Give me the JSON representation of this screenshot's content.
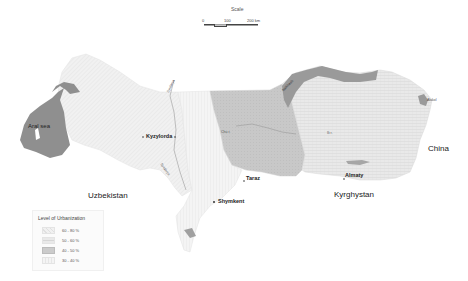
{
  "scale": {
    "title": "Scale",
    "ticks": [
      "0",
      "100",
      "200 km"
    ]
  },
  "countries": {
    "uzbekistan": "Uzbekistan",
    "kyrghystan": "Kyrghystan",
    "china": "China"
  },
  "water": {
    "aral_sea": "Aral sea",
    "balkhash": "Balkhash",
    "alakol": "Alakol",
    "syrdarya_north": "Syrdarya",
    "syrdarya_south": "Syrdarya",
    "chu": "Chu r.",
    "ili": "Ili r."
  },
  "cities": {
    "kyzylorda": "Kyzylorda",
    "taraz": "Taraz",
    "shymkent": "Shymkent",
    "almaty": "Almaty"
  },
  "legend": {
    "title": "Level of Urbanization",
    "items": [
      {
        "label": "60 - 80 %",
        "color": "#ececec"
      },
      {
        "label": "50 - 60 %",
        "color": "#e2e2e2"
      },
      {
        "label": "40 - 50 %",
        "color": "#d2d2d2"
      },
      {
        "label": "30 - 40 %",
        "color": "#f4f4f4"
      }
    ]
  },
  "colors": {
    "kyzylorda_region": "#efefef",
    "south_kaz_region": "#f2f2f2",
    "zhambyl_region": "#c9c9c9",
    "almaty_region": "#e4e4e4",
    "water": "#8f8f8f",
    "text": "#222222"
  }
}
